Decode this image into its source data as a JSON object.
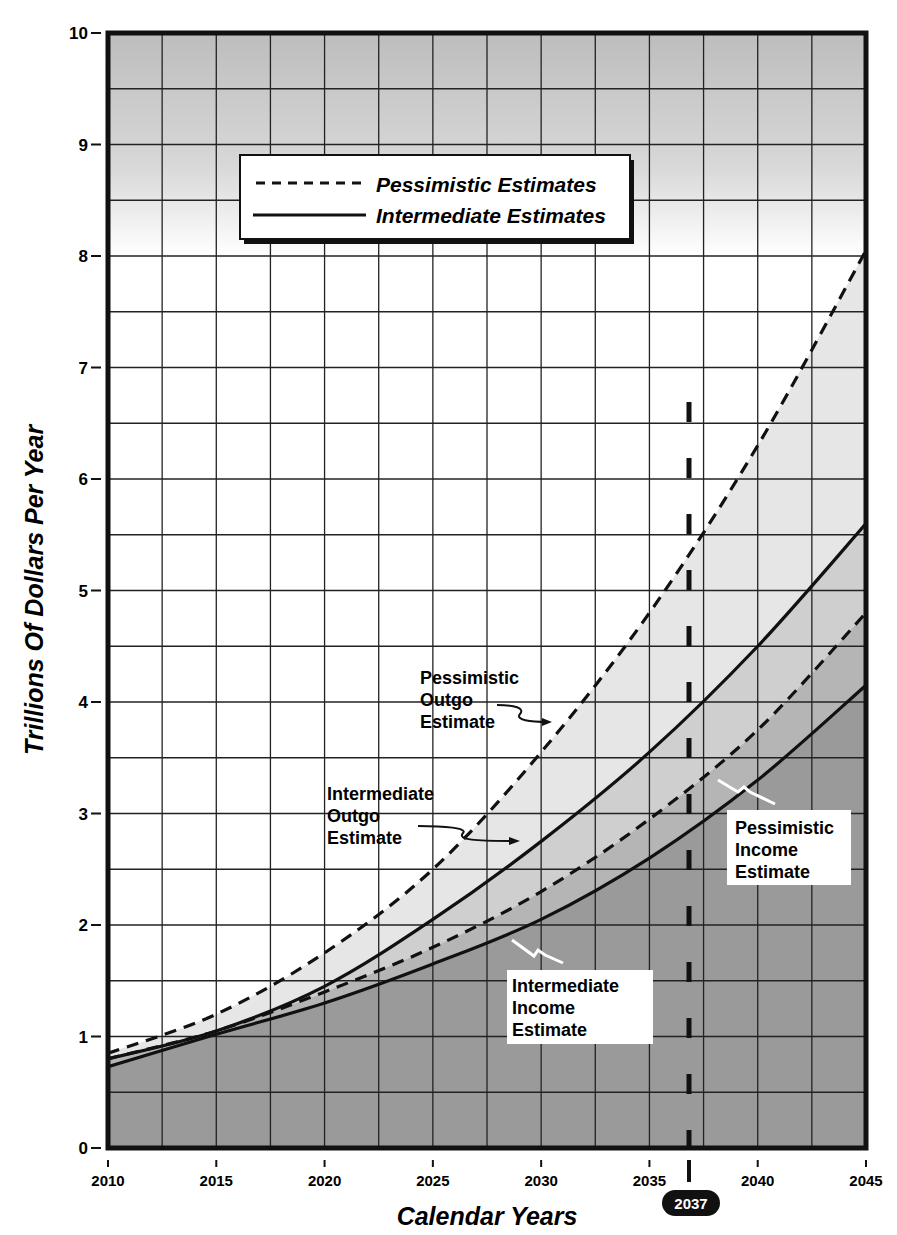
{
  "chart_data": {
    "type": "line",
    "title": "",
    "xlabel": "Calendar Years",
    "ylabel": "Trillions Of Dollars Per Year",
    "x": [
      2010,
      2015,
      2020,
      2025,
      2030,
      2035,
      2040,
      2045
    ],
    "xlim": [
      2010,
      2045
    ],
    "ylim": [
      0,
      10
    ],
    "x_ticks": [
      "2010",
      "2015",
      "2020",
      "2025",
      "2030",
      "2035",
      "2040",
      "2045"
    ],
    "y_ticks": [
      "0",
      "1",
      "2",
      "3",
      "4",
      "5",
      "6",
      "7",
      "8",
      "9",
      "10"
    ],
    "grid": true,
    "series": [
      {
        "name": "Pessimistic Outgo Estimate",
        "style": "dashed",
        "values": [
          0.85,
          1.2,
          1.75,
          2.5,
          3.55,
          4.8,
          6.3,
          8.05
        ]
      },
      {
        "name": "Intermediate Outgo Estimate",
        "style": "solid",
        "values": [
          0.8,
          1.05,
          1.45,
          2.05,
          2.75,
          3.55,
          4.5,
          5.6
        ]
      },
      {
        "name": "Pessimistic Income Estimate",
        "style": "dashed",
        "values": [
          0.8,
          1.05,
          1.4,
          1.8,
          2.3,
          2.95,
          3.75,
          4.8
        ]
      },
      {
        "name": "Intermediate Income Estimate",
        "style": "solid",
        "values": [
          0.73,
          1.02,
          1.3,
          1.65,
          2.05,
          2.6,
          3.3,
          4.15
        ]
      }
    ],
    "legend": {
      "position": "upper-left",
      "entries": [
        {
          "label": "Pessimistic Estimates",
          "style": "dashed"
        },
        {
          "label": "Intermediate Estimates",
          "style": "solid"
        }
      ]
    },
    "annotations": [
      {
        "text": [
          "Pessimistic",
          "Outgo",
          "Estimate"
        ]
      },
      {
        "text": [
          "Intermediate",
          "Outgo",
          "Estimate"
        ]
      },
      {
        "text": [
          "Pessimistic",
          "Income",
          "Estimate"
        ]
      },
      {
        "text": [
          "Intermediate",
          "Income",
          "Estimate"
        ]
      }
    ],
    "marker": {
      "x": 2037,
      "label": "2037",
      "style": "dashed vertical line"
    }
  },
  "labels": {
    "ylabel": "Trillions Of Dollars Per Year",
    "xlabel": "Calendar Years",
    "legend_pess": "Pessimistic Estimates",
    "legend_int": "Intermediate Estimates",
    "marker": "2037",
    "po": [
      "Pessimistic",
      "Outgo",
      "Estimate"
    ],
    "io": [
      "Intermediate",
      "Outgo",
      "Estimate"
    ],
    "pi": [
      "Pessimistic",
      "Income",
      "Estimate"
    ],
    "ii": [
      "Intermediate",
      "Income",
      "Estimate"
    ]
  }
}
